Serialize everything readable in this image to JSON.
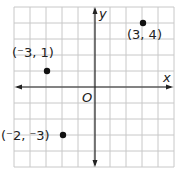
{
  "chart_data": {
    "type": "scatter",
    "title": "",
    "xlabel": "x",
    "ylabel": "y",
    "origin_label": "O",
    "xlim": [
      -5,
      5
    ],
    "ylim": [
      -5,
      5
    ],
    "grid": true,
    "grid_step": 1,
    "points": [
      {
        "x": 3,
        "y": 4,
        "label": "(3, 4)"
      },
      {
        "x": -3,
        "y": 1,
        "label": "(⁻3, 1)"
      },
      {
        "x": -2,
        "y": -3,
        "label": "(⁻2, ⁻3)"
      }
    ]
  },
  "colors": {
    "grid": "#c8c8c8",
    "axis": "#222222",
    "point": "#111111"
  }
}
